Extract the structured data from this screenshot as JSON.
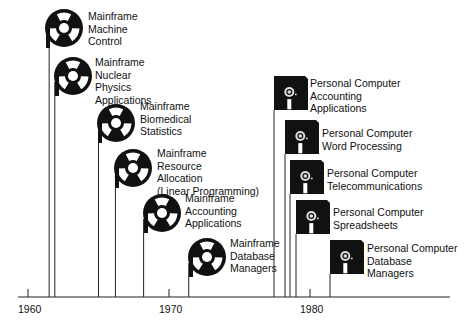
{
  "axis": {
    "start_year": 1960,
    "ticks": [
      {
        "year": 1960,
        "label": "1960"
      },
      {
        "year": 1970,
        "label": "1970"
      },
      {
        "year": 1980,
        "label": "1980"
      }
    ]
  },
  "mainframe_events": [
    {
      "year": 1961.5,
      "icon": "tape-reel-icon",
      "lines": [
        "Mainframe",
        "Machine",
        "Control"
      ]
    },
    {
      "year": 1961.9,
      "icon": "tape-reel-icon",
      "lines": [
        "Mainframe",
        "Nuclear",
        "Physics",
        "Applications"
      ]
    },
    {
      "year": 1965.0,
      "icon": "tape-reel-icon",
      "lines": [
        "Mainframe",
        "Biomedical",
        "Statistics"
      ]
    },
    {
      "year": 1966.2,
      "icon": "tape-reel-icon",
      "lines": [
        "Mainframe",
        "Resource",
        "Allocation",
        "(Linear Programming)"
      ]
    },
    {
      "year": 1968.2,
      "icon": "tape-reel-icon",
      "lines": [
        "Mainframe",
        "Accounting",
        "Applications"
      ]
    },
    {
      "year": 1971.4,
      "icon": "tape-reel-icon",
      "lines": [
        "Mainframe",
        "Database",
        "Managers"
      ]
    }
  ],
  "pc_events": [
    {
      "year": 1977.5,
      "icon": "floppy-disk-icon",
      "lines": [
        "Personal Computer",
        "Accounting",
        "Applications"
      ]
    },
    {
      "year": 1978.3,
      "icon": "floppy-disk-icon",
      "lines": [
        "Personal Computer",
        "Word Processing"
      ]
    },
    {
      "year": 1978.7,
      "icon": "floppy-disk-icon",
      "lines": [
        "Personal Computer",
        "Telecommunications"
      ]
    },
    {
      "year": 1979.1,
      "icon": "floppy-disk-icon",
      "lines": [
        "Personal Computer",
        "Spreadsheets"
      ]
    },
    {
      "year": 1981.5,
      "icon": "floppy-disk-icon",
      "lines": [
        "Personal Computer",
        "Database",
        "Managers"
      ]
    }
  ]
}
